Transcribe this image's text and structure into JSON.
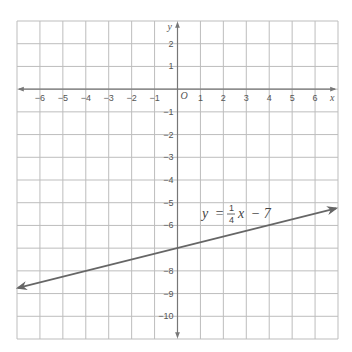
{
  "chart_data": {
    "type": "line",
    "title": "",
    "xlabel": "x",
    "ylabel": "y",
    "origin_label": "O",
    "xlim": [
      -7,
      7
    ],
    "ylim": [
      -11,
      3
    ],
    "grid": true,
    "x_ticks": [
      -6,
      -5,
      -4,
      -3,
      -2,
      -1,
      1,
      2,
      3,
      4,
      5,
      6
    ],
    "x_tick_labels": [
      "−6",
      "−5",
      "−4",
      "−3",
      "−2",
      "−1",
      "1",
      "2",
      "3",
      "4",
      "5",
      "6"
    ],
    "y_ticks": [
      2,
      1,
      -1,
      -2,
      -3,
      -4,
      -5,
      -6,
      -8,
      -9,
      -10
    ],
    "y_tick_labels": [
      "2",
      "1",
      "−1",
      "−2",
      "−3",
      "−4",
      "−5",
      "−6",
      "−8",
      "−9",
      "−10"
    ],
    "series": [
      {
        "name": "y = 1/4 x − 7",
        "slope": 0.25,
        "intercept": -7,
        "x": [
          -7,
          7
        ],
        "y": [
          -8.75,
          -5.25
        ],
        "arrows": "both"
      }
    ],
    "annotations": [
      {
        "text": "y = 1/4 x − 7",
        "x": 2.6,
        "y": -5.1
      }
    ]
  },
  "labels": {
    "equation_y": "y",
    "equation_eq": "=",
    "equation_num": "1",
    "equation_den": "4",
    "equation_x": "x",
    "equation_rest": "− 7"
  },
  "colors": {
    "grid": "#bdbdbd",
    "axis": "#777777",
    "line": "#666666",
    "text": "#555555"
  }
}
